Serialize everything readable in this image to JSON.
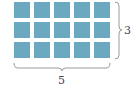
{
  "diagram": {
    "type": "array-grid",
    "rows": 3,
    "columns": 5,
    "cell_color": "#6aa9bf",
    "brace_color": "#9a9a9a",
    "labels": {
      "columns": "5",
      "rows": "3"
    }
  }
}
